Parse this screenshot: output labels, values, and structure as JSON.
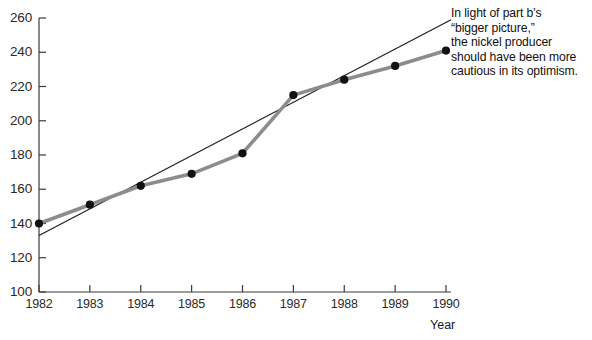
{
  "chart_data": {
    "type": "line",
    "title": "",
    "xlabel": "Year",
    "ylabel": "",
    "xlim": [
      1982,
      1990
    ],
    "ylim": [
      100,
      260
    ],
    "grid": false,
    "legend": "none",
    "x": [
      1982,
      1983,
      1984,
      1985,
      1986,
      1987,
      1988,
      1989,
      1990
    ],
    "xtick_labels": [
      "1982",
      "1983",
      "1984",
      "1985",
      "1986",
      "1987",
      "1988",
      "1989",
      "1990"
    ],
    "ytick_labels": [
      "100",
      "120",
      "140",
      "160",
      "180",
      "200",
      "220",
      "240",
      "260"
    ],
    "yticks": [
      100,
      120,
      140,
      160,
      180,
      200,
      220,
      240,
      260
    ],
    "series": [
      {
        "name": "data",
        "style": "thick-gray-line-with-black-markers",
        "color": "#8c8c8c",
        "marker_color": "#111111",
        "values": [
          140,
          151,
          162,
          169,
          181,
          215,
          224,
          232,
          241
        ]
      },
      {
        "name": "trend-line",
        "style": "thin-black-straight-line",
        "color": "#1a1a1a",
        "endpoints": [
          [
            1982,
            133
          ],
          [
            1990.1,
            259
          ]
        ]
      }
    ],
    "annotations": [
      {
        "name": "commentary",
        "text": "In light of part b's\n“bigger picture,”\nthe nickel producer\nshould have been more\ncautious in its optimism."
      }
    ]
  },
  "axis": {
    "x_title": "Year"
  }
}
